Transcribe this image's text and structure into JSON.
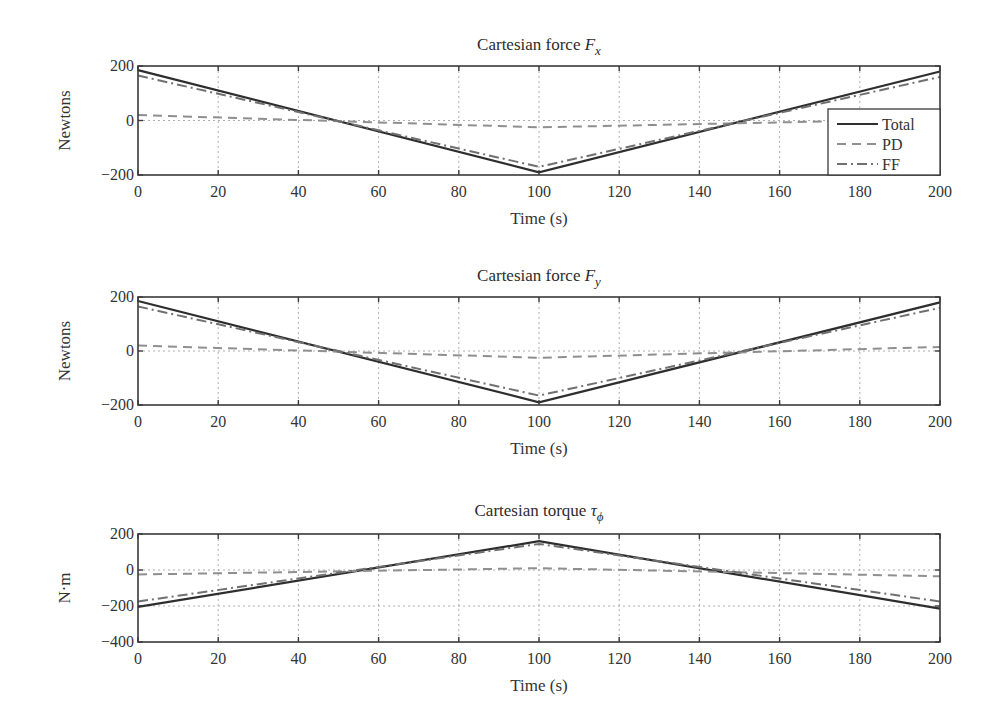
{
  "figure": {
    "x_label": "Time (s)",
    "x_ticks": [
      "0",
      "20",
      "40",
      "60",
      "80",
      "100",
      "120",
      "140",
      "160",
      "180",
      "200"
    ],
    "legend": [
      {
        "name": "Total",
        "style": "solid"
      },
      {
        "name": "PD",
        "style": "dashed"
      },
      {
        "name": "FF",
        "style": "dash-dot"
      }
    ],
    "colors": {
      "total": "#2e2e2e",
      "pd": "#8f8f8f",
      "ff": "#707070",
      "grid": "#9a9a9a"
    }
  },
  "plots": [
    {
      "title_main": "Cartesian force ",
      "title_sym": "F",
      "title_sub": "x",
      "ylabel": "Newtons",
      "y_ticks": [
        "200",
        "0",
        "−200"
      ]
    },
    {
      "title_main": "Cartesian force ",
      "title_sym": "F",
      "title_sub": "y",
      "ylabel": "Newtons",
      "y_ticks": [
        "200",
        "0",
        "−200"
      ]
    },
    {
      "title_main": "Cartesian torque ",
      "title_sym": "τ",
      "title_sub": "ϕ",
      "ylabel": "N·m",
      "y_ticks": [
        "200",
        "0",
        "−200",
        "−400"
      ]
    }
  ],
  "chart_data": [
    {
      "type": "line",
      "title": "Cartesian force F_x",
      "xlabel": "Time (s)",
      "ylabel": "Newtons",
      "xlim": [
        0,
        200
      ],
      "ylim": [
        -200,
        200
      ],
      "grid": true,
      "legend_position": "lower right (inside)",
      "x": [
        0,
        100,
        200
      ],
      "series": [
        {
          "name": "Total",
          "values": [
            185,
            -190,
            180
          ]
        },
        {
          "name": "PD",
          "values": [
            20,
            -25,
            5
          ]
        },
        {
          "name": "FF",
          "values": [
            165,
            -170,
            160
          ]
        }
      ]
    },
    {
      "type": "line",
      "title": "Cartesian force F_y",
      "xlabel": "Time (s)",
      "ylabel": "Newtons",
      "xlim": [
        0,
        200
      ],
      "ylim": [
        -200,
        200
      ],
      "grid": true,
      "x": [
        0,
        100,
        200
      ],
      "series": [
        {
          "name": "Total",
          "values": [
            185,
            -190,
            180
          ]
        },
        {
          "name": "PD",
          "values": [
            20,
            -25,
            15
          ]
        },
        {
          "name": "FF",
          "values": [
            165,
            -165,
            160
          ]
        }
      ]
    },
    {
      "type": "line",
      "title": "Cartesian torque τ_ϕ",
      "xlabel": "Time (s)",
      "ylabel": "N·m",
      "xlim": [
        0,
        200
      ],
      "ylim": [
        -400,
        200
      ],
      "grid": true,
      "x": [
        0,
        100,
        200
      ],
      "series": [
        {
          "name": "Total",
          "values": [
            -205,
            160,
            -215
          ]
        },
        {
          "name": "PD",
          "values": [
            -25,
            10,
            -35
          ]
        },
        {
          "name": "FF",
          "values": [
            -175,
            145,
            -175
          ]
        }
      ]
    }
  ]
}
